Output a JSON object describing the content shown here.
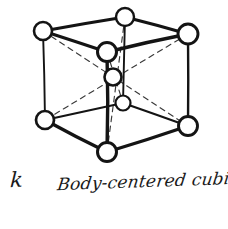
{
  "figure": {
    "panel_label": "k",
    "caption": "Body-centered cubic",
    "alt_description": "Hand-drawn body-centered cubic unit cell with eight corner atoms and one body-center atom",
    "colors": {
      "background": "#ffffff",
      "ink": "#1a1a1a",
      "edge_stroke": "#141414",
      "diagonal_stroke": "#3a3a3a",
      "atom_fill": "#ffffff"
    },
    "lattice": {
      "type": "body-centered cubic",
      "corner_atom_count": 8,
      "center_atom_count": 1,
      "total_atoms_drawn": 9,
      "edge_count": 12,
      "body_diagonal_count": 4,
      "atoms": [
        {
          "name": "top-back-left",
          "x": 43,
          "y": 31,
          "r": 9,
          "hidden": false
        },
        {
          "name": "top-back-center",
          "x": 125,
          "y": 17,
          "r": 9,
          "hidden": false
        },
        {
          "name": "top-front-right",
          "x": 188,
          "y": 34,
          "r": 10,
          "hidden": false
        },
        {
          "name": "top-front-left",
          "x": 107,
          "y": 52,
          "r": 9.5,
          "hidden": false
        },
        {
          "name": "center",
          "x": 113,
          "y": 77,
          "r": 8.5,
          "hidden": false
        },
        {
          "name": "bottom-back",
          "x": 123,
          "y": 103,
          "r": 7.5,
          "hidden": true
        },
        {
          "name": "bottom-left",
          "x": 45,
          "y": 120,
          "r": 9,
          "hidden": false
        },
        {
          "name": "bottom-right",
          "x": 188,
          "y": 126,
          "r": 9.5,
          "hidden": false
        },
        {
          "name": "bottom-front",
          "x": 107,
          "y": 152,
          "r": 9.5,
          "hidden": false
        }
      ],
      "edges": [
        {
          "from": "top-back-left",
          "to": "top-back-center",
          "style": "solid"
        },
        {
          "from": "top-back-center",
          "to": "top-front-right",
          "style": "solid"
        },
        {
          "from": "top-front-right",
          "to": "top-front-left",
          "style": "solid"
        },
        {
          "from": "top-front-left",
          "to": "top-back-left",
          "style": "solid"
        },
        {
          "from": "top-back-left",
          "to": "bottom-left",
          "style": "solid"
        },
        {
          "from": "top-back-center",
          "to": "bottom-back",
          "style": "solid"
        },
        {
          "from": "top-front-right",
          "to": "bottom-right",
          "style": "solid"
        },
        {
          "from": "top-front-left",
          "to": "bottom-front",
          "style": "solid"
        },
        {
          "from": "bottom-left",
          "to": "bottom-back",
          "style": "solid"
        },
        {
          "from": "bottom-back",
          "to": "bottom-right",
          "style": "solid"
        },
        {
          "from": "bottom-right",
          "to": "bottom-front",
          "style": "solid"
        },
        {
          "from": "bottom-front",
          "to": "bottom-left",
          "style": "solid"
        }
      ],
      "body_diagonals": [
        {
          "from": "top-back-left",
          "to": "bottom-right",
          "style": "dashed"
        },
        {
          "from": "top-back-center",
          "to": "bottom-front",
          "style": "dashed"
        },
        {
          "from": "top-front-right",
          "to": "bottom-left",
          "style": "dashed"
        },
        {
          "from": "top-front-left",
          "to": "bottom-back",
          "style": "dashed"
        }
      ]
    }
  }
}
